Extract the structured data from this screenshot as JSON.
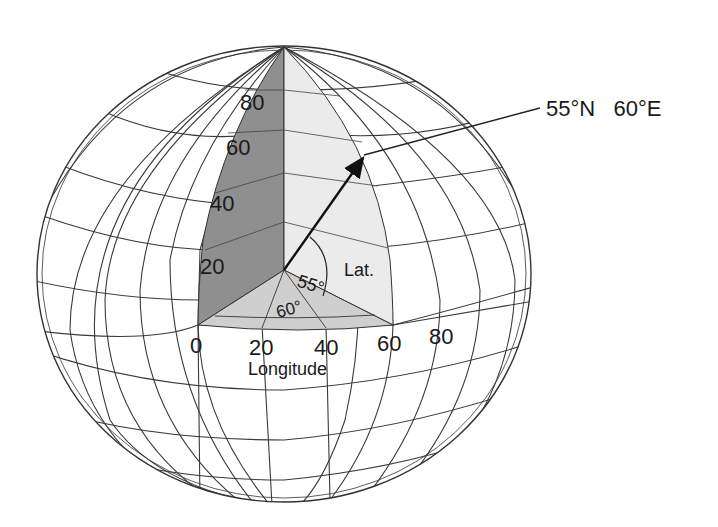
{
  "diagram": {
    "point_label": "55°N   60°E",
    "latitude_ticks": [
      "80",
      "60",
      "40",
      "20"
    ],
    "longitude_ticks": [
      "0",
      "20",
      "40",
      "60",
      "80"
    ],
    "longitude_axis_label": "Longitude",
    "latitude_angle_label": "55°",
    "latitude_abbrev": "Lat.",
    "longitude_angle_label": "60°",
    "colors": {
      "line": "#333333",
      "dark_wedge": "#8f8f8f",
      "light_wedge": "#ebebeb",
      "equatorial_wedge": "#cfcfcf",
      "background": "#ffffff"
    }
  }
}
